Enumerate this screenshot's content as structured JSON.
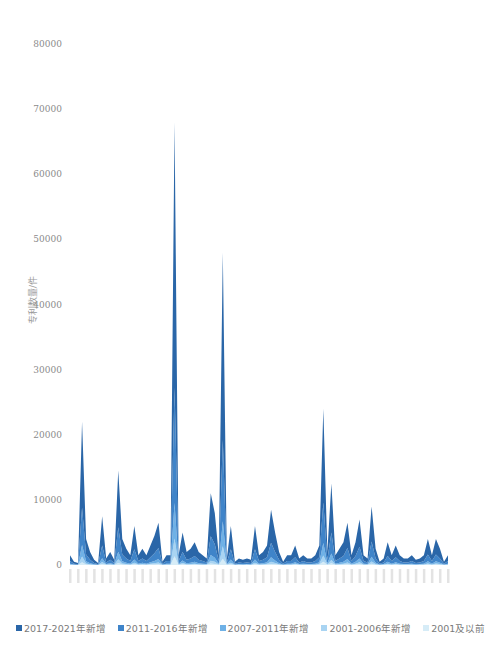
{
  "chart_data": {
    "type": "area",
    "stacked": true,
    "title": "",
    "xlabel": "",
    "ylabel": "专利数量/件",
    "ylim": [
      0,
      80000
    ],
    "yticks": [
      0,
      10000,
      20000,
      30000,
      40000,
      50000,
      60000,
      70000,
      80000
    ],
    "ytick_labels": [
      "0",
      "10000",
      "20000",
      "30000",
      "40000",
      "50000",
      "60000",
      "70000",
      "80000"
    ],
    "grid": false,
    "legend_position": "bottom",
    "x_note": "category labels along x-axis are rendered too small to read",
    "totals": [
      1500,
      500,
      300,
      22000,
      4000,
      2000,
      800,
      300,
      7500,
      1000,
      2000,
      800,
      14500,
      4000,
      2500,
      1500,
      6000,
      1500,
      2500,
      1500,
      3000,
      4500,
      6500,
      500,
      1500,
      1500,
      68000,
      1500,
      5000,
      2000,
      2500,
      3500,
      2000,
      1500,
      1000,
      11000,
      8000,
      1500,
      48000,
      1000,
      6000,
      500,
      1000,
      800,
      1000,
      800,
      6000,
      1500,
      2000,
      3000,
      8500,
      5000,
      2000,
      500,
      1500,
      1500,
      3000,
      1000,
      1500,
      1000,
      1000,
      1500,
      3000,
      24000,
      2000,
      12500,
      1500,
      2500,
      3500,
      6500,
      1500,
      3500,
      7000,
      1500,
      1000,
      9000,
      2500,
      500,
      1000,
      3500,
      1500,
      3000,
      1500,
      1000,
      1000,
      1500,
      800,
      1000,
      1500,
      4000,
      1500,
      4000,
      2500,
      500,
      1500
    ],
    "series": [
      {
        "name": "2001及以前",
        "color": "#d6ecf7",
        "share": 0.02
      },
      {
        "name": "2001-2006年新增",
        "color": "#a9d4f2",
        "share": 0.04
      },
      {
        "name": "2007-2011年新增",
        "color": "#6fb1e6",
        "share": 0.08
      },
      {
        "name": "2011-2016年新增",
        "color": "#3f84c9",
        "share": 0.26
      },
      {
        "name": "2017-2021年新增",
        "color": "#2a66a8",
        "share": 0.6
      }
    ]
  },
  "legend": {
    "items": [
      {
        "label": "2017-2021年新增",
        "color": "#2a66a8"
      },
      {
        "label": "2011-2016年新增",
        "color": "#3f84c9"
      },
      {
        "label": "2007-2011年新增",
        "color": "#6fb1e6"
      },
      {
        "label": "2001-2006年新增",
        "color": "#a9d4f2"
      },
      {
        "label": "2001及以前",
        "color": "#d6ecf7"
      }
    ]
  }
}
